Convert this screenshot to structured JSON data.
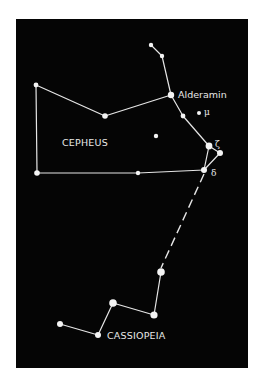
{
  "diagram": {
    "type": "star-chart",
    "background_color": "#050505",
    "line_color": "#e6e6e6",
    "constellations": [
      {
        "name": "CEPHEUS",
        "label_pos": [
          58,
          143
        ]
      },
      {
        "name": "CASSIOPEIA",
        "label_pos": [
          107,
          339
        ]
      }
    ],
    "star_labels": {
      "alderamin": "Alderamin",
      "mu": "μ",
      "zeta": "ζ",
      "delta": "δ"
    },
    "stars": [
      {
        "id": "c-top",
        "x": 151,
        "y": 45,
        "r": 2.2
      },
      {
        "id": "c-top2",
        "x": 162,
        "y": 56,
        "r": 2.2
      },
      {
        "id": "alderamin",
        "x": 171,
        "y": 95,
        "r": 3.2
      },
      {
        "id": "c-mid",
        "x": 183,
        "y": 116,
        "r": 2.4
      },
      {
        "id": "mu",
        "x": 199,
        "y": 113,
        "r": 2.0
      },
      {
        "id": "zeta",
        "x": 209,
        "y": 146,
        "r": 3.4
      },
      {
        "id": "epsilon",
        "x": 220,
        "y": 153,
        "r": 3.0
      },
      {
        "id": "delta",
        "x": 204,
        "y": 170,
        "r": 3.0
      },
      {
        "id": "c-left-top",
        "x": 36,
        "y": 85,
        "r": 2.4
      },
      {
        "id": "c-mid-top",
        "x": 105,
        "y": 116,
        "r": 2.8
      },
      {
        "id": "c-left-bot",
        "x": 37,
        "y": 173,
        "r": 2.8
      },
      {
        "id": "c-mid-bot",
        "x": 138,
        "y": 173,
        "r": 2.2
      },
      {
        "id": "c-loose",
        "x": 156,
        "y": 136,
        "r": 2.2
      },
      {
        "id": "cas-1",
        "x": 161,
        "y": 272,
        "r": 3.8
      },
      {
        "id": "cas-2",
        "x": 154,
        "y": 315,
        "r": 3.6
      },
      {
        "id": "cas-3",
        "x": 113,
        "y": 303,
        "r": 3.8
      },
      {
        "id": "cas-4",
        "x": 98,
        "y": 335,
        "r": 3.0
      },
      {
        "id": "cas-5",
        "x": 60,
        "y": 324,
        "r": 3.0
      }
    ],
    "lines": [
      [
        "c-top",
        "c-top2"
      ],
      [
        "c-top2",
        "alderamin"
      ],
      [
        "alderamin",
        "c-mid"
      ],
      [
        "c-mid",
        "zeta"
      ],
      [
        "zeta",
        "epsilon"
      ],
      [
        "zeta",
        "delta"
      ],
      [
        "epsilon",
        "delta"
      ],
      [
        "alderamin",
        "c-mid-top"
      ],
      [
        "c-mid-top",
        "c-left-top"
      ],
      [
        "c-left-top",
        "c-left-bot"
      ],
      [
        "c-left-bot",
        "c-mid-bot"
      ],
      [
        "c-mid-bot",
        "delta"
      ],
      [
        "cas-1",
        "cas-2"
      ],
      [
        "cas-2",
        "cas-3"
      ],
      [
        "cas-3",
        "cas-4"
      ],
      [
        "cas-4",
        "cas-5"
      ]
    ],
    "dashed_lines": [
      [
        "delta",
        "cas-1"
      ]
    ]
  }
}
